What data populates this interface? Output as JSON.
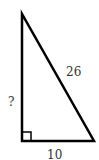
{
  "diagram": {
    "type": "right-triangle",
    "vertices": {
      "top": [
        22,
        14
      ],
      "bottom_left": [
        22,
        141
      ],
      "bottom_right": [
        94,
        141
      ]
    },
    "stroke_color": "#000000",
    "label_color": "#333333",
    "labels": {
      "hypotenuse": "26",
      "vertical_leg": "?",
      "base": "10"
    },
    "right_angle_marker": {
      "corner": "bottom_left",
      "size": 9
    }
  }
}
